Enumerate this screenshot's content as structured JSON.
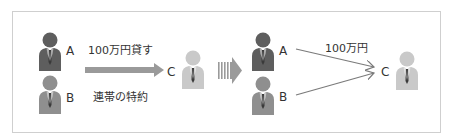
{
  "colors": {
    "frame": "#cfcfcf",
    "person_a": "#5e5e5e",
    "person_b": "#8f8f8f",
    "person_c": "#c9c9c9",
    "arrow": "#9a9a9a",
    "line": "#7a7a7a",
    "text": "#333333"
  },
  "left": {
    "person_a_label": "A",
    "person_b_label": "B",
    "person_c_label": "C",
    "loan_label": "100万円貸す",
    "clause_label": "連帯の特約"
  },
  "right": {
    "person_a_label": "A",
    "person_b_label": "B",
    "person_c_label": "C",
    "amount_label": "100万円"
  }
}
